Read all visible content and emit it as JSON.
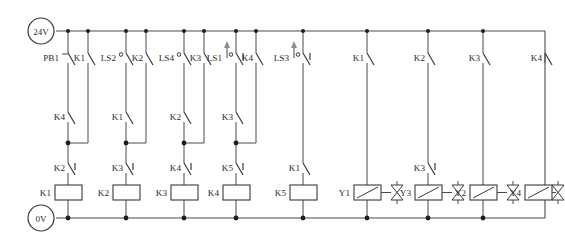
{
  "diagram": {
    "type": "ladder-logic-schematic",
    "colors": {
      "wire": "#4a4a4a",
      "symbol": "#3a3a3a",
      "node": "#1d1d1d",
      "actuator": "#8c8c8c",
      "background": "#ffffff"
    },
    "power": {
      "top_rail_label": "24V",
      "bottom_rail_label": "0V"
    },
    "rungs": [
      {
        "id": "rung-1",
        "coil": "K1",
        "series_top": [
          {
            "label": "PB1",
            "kind": "pushbutton-no"
          },
          {
            "label": "K1",
            "kind": "contact-no"
          }
        ],
        "branch": {
          "label": "K4",
          "kind": "contact-no"
        },
        "series_bottom": [
          {
            "label": "K2",
            "kind": "contact-nc"
          }
        ]
      },
      {
        "id": "rung-2",
        "coil": "K2",
        "series_top": [
          {
            "label": "LS2",
            "kind": "limitswitch-no"
          },
          {
            "label": "K2",
            "kind": "contact-no"
          }
        ],
        "branch": {
          "label": "K1",
          "kind": "contact-no"
        },
        "series_bottom": [
          {
            "label": "K3",
            "kind": "contact-nc"
          }
        ]
      },
      {
        "id": "rung-3",
        "coil": "K3",
        "series_top": [
          {
            "label": "LS4",
            "kind": "limitswitch-no"
          },
          {
            "label": "K3",
            "kind": "contact-no"
          }
        ],
        "branch": {
          "label": "K2",
          "kind": "contact-no"
        },
        "series_bottom": [
          {
            "label": "K4",
            "kind": "contact-nc"
          }
        ]
      },
      {
        "id": "rung-4",
        "coil": "K4",
        "series_top": [
          {
            "label": "LS1",
            "kind": "limitswitch-nc"
          },
          {
            "label": "K4",
            "kind": "contact-no"
          }
        ],
        "branch": {
          "label": "K3",
          "kind": "contact-no"
        },
        "series_bottom": [
          {
            "label": "K5",
            "kind": "contact-nc"
          }
        ]
      },
      {
        "id": "rung-5",
        "coil": "K5",
        "series_top": [
          {
            "label": "LS3",
            "kind": "limitswitch-nc"
          }
        ],
        "branch": null,
        "series_bottom": [
          {
            "label": "K1",
            "kind": "contact-no"
          }
        ]
      },
      {
        "id": "rung-6",
        "coil": "Y1",
        "coil_kind": "solenoid",
        "series_top": [
          {
            "label": "K1",
            "kind": "contact-no"
          }
        ],
        "branch": null,
        "series_bottom": [],
        "indicator": "Y3"
      },
      {
        "id": "rung-7",
        "coil": "Y3",
        "coil_kind": "solenoid",
        "series_top": [
          {
            "label": "K2",
            "kind": "contact-no"
          }
        ],
        "branch": null,
        "series_bottom": [
          {
            "label": "K3",
            "kind": "contact-nc"
          }
        ],
        "indicator": "Y2"
      },
      {
        "id": "rung-8",
        "coil": "Y2",
        "coil_kind": "solenoid",
        "series_top": [
          {
            "label": "K3",
            "kind": "contact-no"
          }
        ],
        "branch": null,
        "series_bottom": [],
        "indicator": "Y4"
      },
      {
        "id": "rung-9",
        "coil": "Y4",
        "coil_kind": "solenoid",
        "series_top": [
          {
            "label": "K4",
            "kind": "contact-no"
          }
        ],
        "branch": null,
        "series_bottom": [],
        "indicator": null
      }
    ],
    "labels": {
      "pb1": "PB1",
      "ls1": "LS1",
      "ls2": "LS2",
      "ls3": "LS3",
      "ls4": "LS4",
      "k1": "K1",
      "k2": "K2",
      "k3": "K3",
      "k4": "K4",
      "k5": "K5",
      "y1": "Y1",
      "y2": "Y2",
      "y3": "Y3",
      "y4": "Y4",
      "v24": "24V",
      "v0": "0V"
    }
  }
}
